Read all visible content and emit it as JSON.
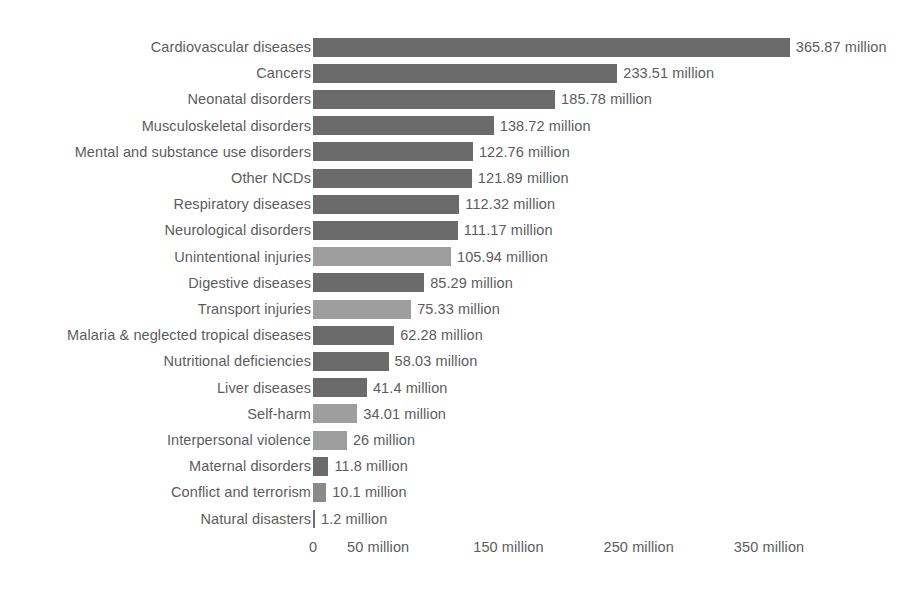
{
  "chart_data": {
    "type": "bar",
    "orientation": "horizontal",
    "title": "",
    "subtitle": "",
    "xlabel": "",
    "ylabel": "",
    "units": "million",
    "grid": false,
    "legend": "none",
    "xlim": [
      0,
      380
    ],
    "axis": {
      "ticks": [
        {
          "value": 0,
          "label": "0"
        },
        {
          "value": 50,
          "label": "50 million"
        },
        {
          "value": 150,
          "label": "150 million"
        },
        {
          "value": 250,
          "label": "250 million"
        },
        {
          "value": 350,
          "label": "350 million"
        }
      ]
    },
    "palette": {
      "disease": "#6b6b6b",
      "injury": "#9e9e9e",
      "mid": "#8a8a8a",
      "text": "#5c5c5e",
      "background": "#ffffff"
    },
    "categories": [
      "Cardiovascular diseases",
      "Cancers",
      "Neonatal disorders",
      "Musculoskeletal disorders",
      "Mental and substance use disorders",
      "Other NCDs",
      "Respiratory diseases",
      "Neurological disorders",
      "Unintentional injuries",
      "Digestive diseases",
      "Transport injuries",
      "Malaria & neglected tropical diseases",
      "Nutritional deficiencies",
      "Liver diseases",
      "Self-harm",
      "Interpersonal violence",
      "Maternal disorders",
      "Conflict and terrorism",
      "Natural disasters"
    ],
    "values": [
      365.87,
      233.51,
      185.78,
      138.72,
      122.76,
      121.89,
      112.32,
      111.17,
      105.94,
      85.29,
      75.33,
      62.28,
      58.03,
      41.4,
      34.01,
      26,
      11.8,
      10.1,
      1.2
    ],
    "value_labels": [
      "365.87 million",
      "233.51 million",
      "185.78 million",
      "138.72 million",
      "122.76 million",
      "121.89 million",
      "112.32 million",
      "111.17 million",
      "105.94 million",
      "85.29 million",
      "75.33 million",
      "62.28 million",
      "58.03 million",
      "41.4 million",
      "34.01 million",
      "26 million",
      "11.8 million",
      "10.1 million",
      "1.2 million"
    ],
    "bar_shades": [
      "dark",
      "dark",
      "dark",
      "dark",
      "dark",
      "dark",
      "dark",
      "dark",
      "light",
      "dark",
      "light",
      "dark",
      "dark",
      "dark",
      "light",
      "light",
      "dark",
      "mid",
      "dark"
    ]
  }
}
